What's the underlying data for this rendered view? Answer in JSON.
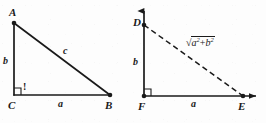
{
  "figure": {
    "background_color": "#fdfdfd",
    "stroke_color": "#1a1a1a",
    "left_triangle": {
      "name": "triangle-abc",
      "vertices": [
        {
          "id": "A",
          "label": "A",
          "x": 14,
          "y": 23,
          "label_x": 9,
          "label_y": 7
        },
        {
          "id": "B",
          "label": "B",
          "x": 110,
          "y": 95,
          "label_x": 105,
          "label_y": 100
        },
        {
          "id": "C",
          "label": "C",
          "x": 14,
          "y": 95,
          "label_x": 8,
          "label_y": 100
        }
      ],
      "sides": [
        {
          "id": "b",
          "label": "b",
          "from": "A",
          "to": "C",
          "label_x": 3,
          "label_y": 56,
          "style": "solid"
        },
        {
          "id": "a",
          "label": "a",
          "from": "C",
          "to": "B",
          "label_x": 58,
          "label_y": 99,
          "style": "solid"
        },
        {
          "id": "c",
          "label": "c",
          "from": "A",
          "to": "B",
          "label_x": 63,
          "label_y": 46,
          "style": "solid"
        }
      ],
      "right_angle": {
        "at": "C",
        "marker": "square",
        "x": 14,
        "y": 95,
        "size": 7
      },
      "annotation": {
        "text": "!",
        "x": 23,
        "y": 82
      }
    },
    "right_triangle": {
      "name": "triangle-dfe",
      "vertices": [
        {
          "id": "D",
          "label": "D",
          "x": 144,
          "y": 25,
          "label_x": 133,
          "label_y": 17
        },
        {
          "id": "E",
          "label": "E",
          "x": 243,
          "y": 96,
          "label_x": 238,
          "label_y": 101
        },
        {
          "id": "F",
          "label": "F",
          "x": 144,
          "y": 96,
          "label_x": 138,
          "label_y": 101
        }
      ],
      "sides": [
        {
          "id": "b",
          "label": "b",
          "from": "D",
          "to": "F",
          "label_x": 133,
          "label_y": 57,
          "style": "solid"
        },
        {
          "id": "a",
          "label": "a",
          "from": "F",
          "to": "E",
          "label_x": 191,
          "label_y": 99,
          "style": "solid"
        },
        {
          "id": "hyp",
          "label": "sqrt(a^2+b^2)",
          "from": "D",
          "to": "E",
          "label_x": 186,
          "label_y": 38,
          "style": "dashed"
        }
      ],
      "hypotenuse_expression": {
        "radical_symbol": "√",
        "base_1": "a",
        "exponent_1": "2",
        "operator": "+",
        "base_2": "b",
        "exponent_2": "2"
      },
      "right_angle": {
        "at": "F",
        "marker": "square",
        "x": 144,
        "y": 96,
        "size": 7
      },
      "axes": [
        {
          "id": "y-axis",
          "direction": "up",
          "tip_x": 144,
          "tip_y": 4
        },
        {
          "id": "x-axis",
          "direction": "right",
          "tip_x": 264,
          "tip_y": 96
        }
      ]
    }
  }
}
